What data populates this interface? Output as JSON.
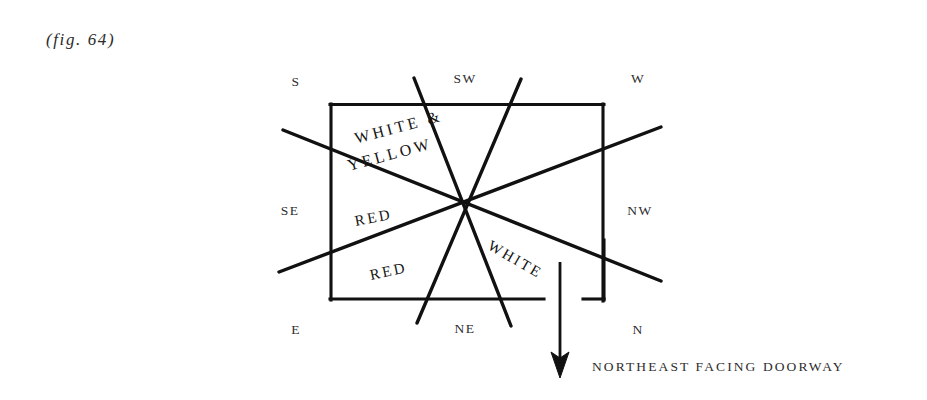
{
  "figure": {
    "label": "(fig. 64)",
    "doorway_caption": "NORTHEAST FACING DOORWAY",
    "ink_color": "#111111",
    "background_color": "#ffffff"
  },
  "compass": {
    "labels": [
      {
        "id": "s",
        "text": "S"
      },
      {
        "id": "sw",
        "text": "SW"
      },
      {
        "id": "w",
        "text": "W"
      },
      {
        "id": "se",
        "text": "SE"
      },
      {
        "id": "nw",
        "text": "NW"
      },
      {
        "id": "e",
        "text": "E"
      },
      {
        "id": "ne",
        "text": "NE"
      },
      {
        "id": "n",
        "text": "N"
      }
    ]
  },
  "rooms": {
    "labels": [
      {
        "id": "white-yellow-line1",
        "text": "WHITE &"
      },
      {
        "id": "white-yellow-line2",
        "text": "YELLOW"
      },
      {
        "id": "red-upper",
        "text": "RED"
      },
      {
        "id": "red-lower",
        "text": "RED"
      },
      {
        "id": "white",
        "text": "WHITE"
      }
    ]
  },
  "diagram_geometry": {
    "type": "floor-plan-compass",
    "plan_rect": {
      "left": 330,
      "top": 104,
      "right": 604,
      "bottom": 300
    },
    "center": {
      "x": 467,
      "y": 205
    },
    "axis_lines": [
      {
        "name": "s-to-n-axis",
        "x1": 283,
        "y1": 130,
        "x2": 660,
        "y2": 281
      },
      {
        "name": "e-to-w-axis",
        "x1": 279,
        "y1": 272,
        "x2": 661,
        "y2": 127
      },
      {
        "name": "sw-to-ne-axis",
        "x1": 414,
        "y1": 78,
        "x2": 511,
        "y2": 326
      },
      {
        "name": "w-to-ne-axis",
        "x1": 521,
        "y1": 79,
        "x2": 417,
        "y2": 323
      }
    ],
    "doorway": {
      "gap_start_x": 544,
      "gap_end_x": 583,
      "jamb_x": 605,
      "jamb_top_y": 240,
      "jamb_bottom_y": 300,
      "arrow": {
        "x": 560,
        "y_start": 262,
        "y_end": 376
      }
    }
  }
}
